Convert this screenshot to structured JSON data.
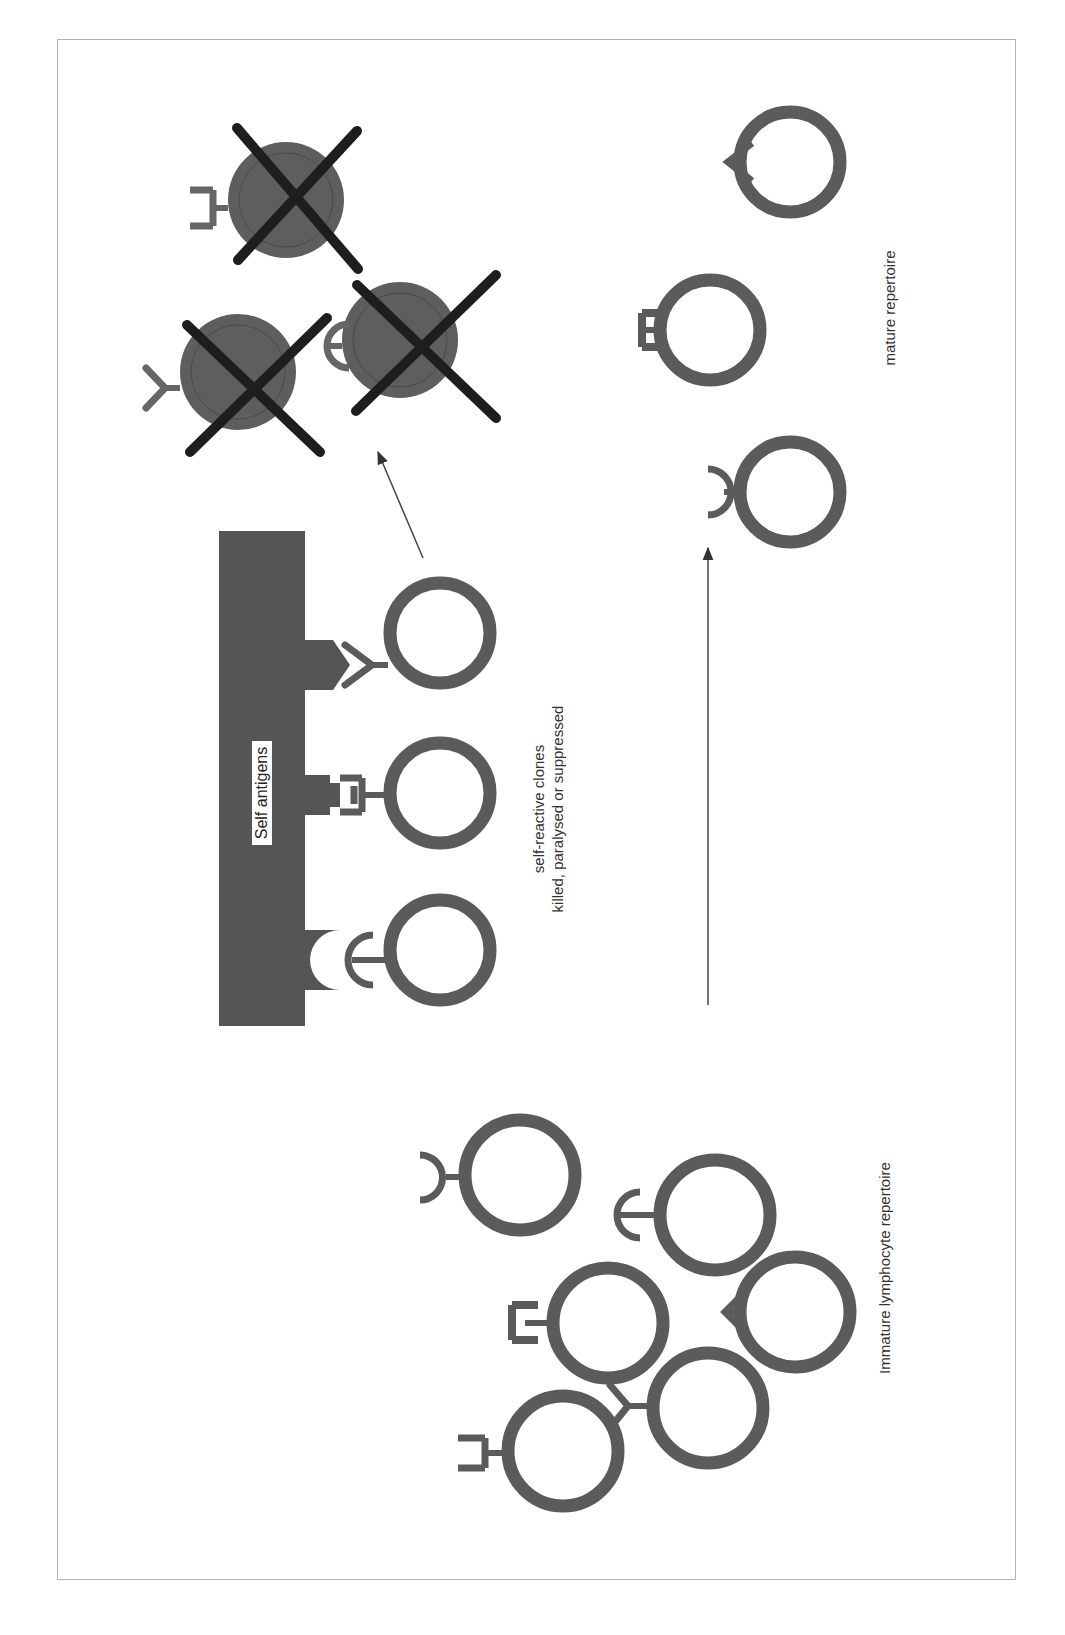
{
  "colors": {
    "cell_ring": "#5b5b5b",
    "dead_cell_fill": "#5e5e5e",
    "cross": "#1e1e1e",
    "bar": "#555555",
    "arrow": "#444444",
    "frame": "#b4b4b4",
    "text": "#333333"
  },
  "labels": {
    "self_antigens": "Self antigens",
    "self_reactive_line1": "self-reactive clones",
    "self_reactive_line2": "killed, paralysed or suppressed",
    "mature": "mature repertoire",
    "immature": "Immature lymphocyte repertoire"
  },
  "diagram": {
    "groups": [
      {
        "name": "immature-repertoire",
        "cells": 6,
        "receptor_types": [
          "half-circle",
          "hook",
          "E-shape",
          "arrow-head",
          "Y-fork",
          "C-bracket"
        ]
      },
      {
        "name": "self-reactive-clones",
        "cells": 3,
        "receptor_types": [
          "Y-fork",
          "E-shape",
          "hook"
        ],
        "bound_to": "Self antigens"
      },
      {
        "name": "deleted-clones",
        "cells": 3,
        "marked": "X"
      },
      {
        "name": "mature-repertoire",
        "cells": 3,
        "receptor_types": [
          "arrow-head",
          "E-shape",
          "half-circle"
        ]
      }
    ],
    "arrows": [
      {
        "from": "self-reactive-clones",
        "to": "deleted-clones"
      },
      {
        "from": "immature-repertoire",
        "to": "mature-repertoire"
      }
    ]
  }
}
